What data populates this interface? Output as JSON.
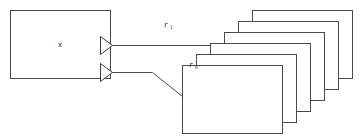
{
  "diagram": {
    "background_color": "#ffffff",
    "stroke_color": "#4a4a4a",
    "fill_color": "#ffffff",
    "width": 364,
    "height": 136,
    "source_entity": {
      "label": "x",
      "x": 10,
      "y": 10,
      "width": 100,
      "height": 68
    },
    "target_stack": {
      "front_label": "One",
      "count": 6,
      "box_width": 100,
      "box_height": 68,
      "rear_x": 252,
      "rear_y": 10,
      "offset_x": -14,
      "offset_y": 11,
      "labels": [
        "One",
        "",
        "",
        "",
        "",
        ""
      ]
    },
    "relationships": [
      {
        "name": "relationship-r1",
        "label": "r",
        "subscript": "1",
        "label_x": 166,
        "label_y": 26,
        "connector": "crowfoot",
        "from_y": 45,
        "to_y": 45
      },
      {
        "name": "relationship-rn",
        "label": "r",
        "subscript": "n",
        "label_x": 191,
        "label_y": 66,
        "connector": "crowfoot",
        "from_y": 72,
        "to_y": 96
      }
    ]
  }
}
